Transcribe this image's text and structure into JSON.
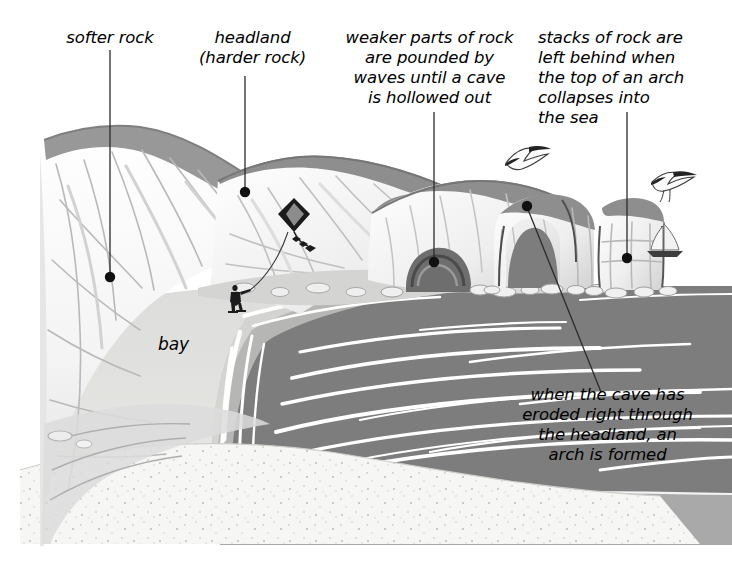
{
  "figure": {
    "type": "coastal-erosion-diagram",
    "width": 732,
    "height": 573,
    "background": "#ffffff"
  },
  "labels": {
    "softer_rock": "softer rock",
    "headland": "headland\n(harder rock)",
    "weaker_parts": "weaker parts of rock\nare pounded by\nwaves until a cave\nis hollowed out",
    "stacks": "stacks of rock are\nleft behind when\nthe top of an arch\ncollapses into\nthe sea",
    "bay": "bay",
    "arch": "when the cave has\neroded right through\nthe headland, an\narch is formed"
  },
  "colors": {
    "sea": "#7d7d7d",
    "sea_far": "#a9a9a9",
    "cliff_light": "#fbfbfb",
    "cliff_shadow": "#d9d9d9",
    "grass_top": "#9a9a9a",
    "grass_top_dark": "#8a8a8a",
    "beach": "#d4d4d2",
    "sand": "#f3f3f1",
    "cave": "#6f6f6f",
    "line": "#2a2a2a",
    "text": "#000000",
    "wave_white": "#ffffff"
  },
  "leaders": [
    {
      "name": "softer-rock",
      "from": [
        110,
        50
      ],
      "to": [
        110,
        277
      ],
      "dot": [
        110,
        277
      ]
    },
    {
      "name": "headland",
      "from": [
        245,
        74
      ],
      "to": [
        245,
        192
      ],
      "dot": [
        245,
        192
      ]
    },
    {
      "name": "weaker-parts",
      "from": [
        434,
        110
      ],
      "to": [
        434,
        262
      ],
      "dot": [
        434,
        262
      ]
    },
    {
      "name": "stacks",
      "from": [
        627,
        110
      ],
      "to": [
        627,
        258
      ],
      "dot": [
        627,
        258
      ]
    },
    {
      "name": "arch",
      "from": [
        527,
        205
      ],
      "to": [
        600,
        390
      ],
      "dot": [
        527,
        205
      ]
    }
  ],
  "scene_elements": {
    "cliff": "chalk-cliff-headland",
    "cave": "sea-cave-in-cliff",
    "arch": "natural-sea-arch",
    "stack": "isolated-rock-stack",
    "bay": "curved-sandy-bay",
    "sea": "grey-sea-with-white-wave-lines",
    "person": "person-flying-kite-on-beach",
    "kite": "diamond-kite",
    "birds": [
      "seagull-left",
      "seagull-right"
    ],
    "boat": "sailing-boat"
  }
}
